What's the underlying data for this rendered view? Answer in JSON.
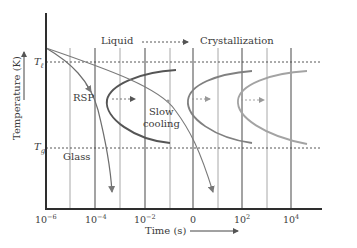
{
  "diagram": {
    "type": "TTT diagram (time-temperature-transformation)",
    "y_axis_label": "Temperature (K)",
    "x_axis_label": "Time (s)",
    "x_ticks": [
      {
        "base": "10",
        "exp": "−6",
        "x": 45
      },
      {
        "base": "10",
        "exp": "−4",
        "x": 95
      },
      {
        "base": "10",
        "exp": "−2",
        "x": 145
      },
      {
        "base": "0",
        "exp": "",
        "x": 193
      },
      {
        "base": "10",
        "exp": "2",
        "x": 242
      },
      {
        "base": "10",
        "exp": "4",
        "x": 291
      }
    ],
    "y_markers": {
      "T_liquidus": {
        "symbol": "T",
        "sub": "ℓ"
      },
      "T_glass": {
        "symbol": "T",
        "sub": "g"
      }
    },
    "region_labels": {
      "liquid": "Liquid",
      "crystallization": "Crystallization",
      "glass": "Glass",
      "rsp": "RSP",
      "slow_cooling_line1": "Slow",
      "slow_cooling_line2": "cooling"
    },
    "colors": {
      "axis": "#2e2e2e",
      "grid_major": "#555555",
      "grid_minor": "#9a9a9a",
      "c_curve_1": "#555555",
      "c_curve_2": "#7a7a7a",
      "c_curve_3": "#a0a0a0",
      "cooling_curve": "#6e6e6e",
      "text": "#3a3a3a"
    }
  }
}
